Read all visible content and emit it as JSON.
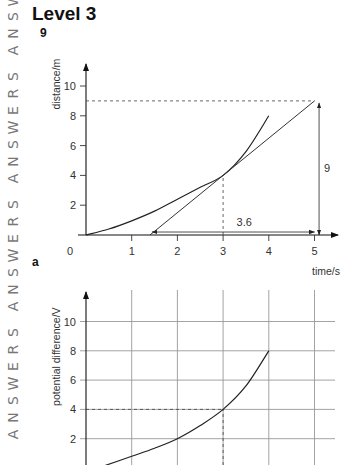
{
  "margin_text": {
    "word": "ANSWERS",
    "color": "#777777"
  },
  "header": {
    "level_title": "Level 3",
    "question_number": "9"
  },
  "part_label": "a",
  "chart_data": [
    {
      "type": "line",
      "title": "",
      "xlabel": "time/s",
      "ylabel": "distance/m",
      "xlim": [
        0,
        5.5
      ],
      "ylim": [
        0,
        11
      ],
      "grid": false,
      "origin_label": "0",
      "x_ticks": [
        1,
        2,
        3,
        4,
        5
      ],
      "x_tick_labels": [
        "1",
        "2",
        "3",
        "4",
        "5"
      ],
      "y_ticks": [
        2,
        4,
        6,
        8,
        10
      ],
      "y_tick_labels": [
        "2",
        "4",
        "6",
        "8",
        "10"
      ],
      "series": [
        {
          "name": "curve",
          "x": [
            0,
            0.5,
            1,
            1.5,
            2,
            2.5,
            3,
            3.5,
            4
          ],
          "y": [
            0,
            0.4,
            0.95,
            1.6,
            2.4,
            3.2,
            4.0,
            5.6,
            8.0
          ]
        },
        {
          "name": "tangent at t=3",
          "x": [
            1.4,
            5
          ],
          "y": [
            0,
            9
          ]
        }
      ],
      "annotations": [
        {
          "kind": "dashed-horizontal",
          "y": 9,
          "x_from": 0,
          "x_to": 5
        },
        {
          "kind": "dashed-vertical",
          "x": 3,
          "y_from": 0,
          "y_to": 4
        },
        {
          "kind": "double-arrow-horizontal",
          "x_from": 1.4,
          "x_to": 5,
          "y": 0.2,
          "label": "3.6"
        },
        {
          "kind": "double-arrow-vertical",
          "x": 5.1,
          "y_from": 0,
          "y_to": 9,
          "label": "9"
        }
      ]
    },
    {
      "type": "line",
      "title": "",
      "xlabel": "",
      "ylabel": "potential difference/V",
      "xlim": [
        0,
        5.5
      ],
      "ylim": [
        0,
        11
      ],
      "grid": true,
      "x_gridlines": [
        1,
        2,
        3,
        4,
        5
      ],
      "y_ticks": [
        2,
        4,
        6,
        8,
        10
      ],
      "y_tick_labels": [
        "2",
        "4",
        "6",
        "8",
        "10"
      ],
      "series": [
        {
          "name": "curve",
          "x": [
            0.4,
            1,
            1.5,
            2,
            2.5,
            3,
            3.5,
            4
          ],
          "y": [
            0.15,
            0.8,
            1.35,
            2.0,
            2.9,
            4.0,
            5.6,
            8.0
          ]
        }
      ],
      "annotations": [
        {
          "kind": "dashed-horizontal",
          "y": 4,
          "x_from": 0,
          "x_to": 3
        },
        {
          "kind": "dashed-vertical",
          "x": 3,
          "y_from": 0,
          "y_to": 4
        }
      ]
    }
  ]
}
